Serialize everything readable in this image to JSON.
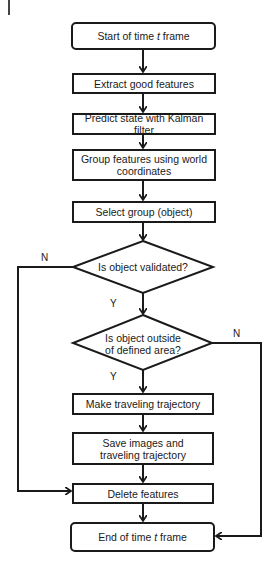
{
  "diagram": {
    "type": "flowchart",
    "nodes": {
      "start": {
        "label_pre": "Start of time ",
        "label_var": "t",
        "label_post": " frame",
        "shape": "rounded"
      },
      "extract": {
        "label": "Extract good features",
        "shape": "rect"
      },
      "predict": {
        "label": "Predict state with Kalman filter",
        "shape": "rect"
      },
      "group": {
        "label": "Group features using world coordinates",
        "shape": "rect"
      },
      "select": {
        "label": "Select group (object)",
        "shape": "rect"
      },
      "validated": {
        "label": "Is object validated?",
        "shape": "diamond"
      },
      "outside": {
        "line1": "Is object outside",
        "line2": "of defined area?",
        "shape": "diamond"
      },
      "make": {
        "label": "Make traveling trajectory",
        "shape": "rect"
      },
      "save": {
        "label": "Save images and traveling trajectory",
        "shape": "rect"
      },
      "delete": {
        "label": "Delete features",
        "shape": "rect"
      },
      "end": {
        "label_pre": "End of time ",
        "label_var": "t",
        "label_post": " frame",
        "shape": "rounded"
      }
    },
    "edge_labels": {
      "validated_no": "N",
      "validated_yes": "Y",
      "outside_no": "N",
      "outside_yes": "Y"
    },
    "edges": [
      [
        "start",
        "extract"
      ],
      [
        "extract",
        "predict"
      ],
      [
        "predict",
        "group"
      ],
      [
        "group",
        "select"
      ],
      [
        "select",
        "validated"
      ],
      [
        "validated",
        "outside",
        "Y"
      ],
      [
        "validated",
        "delete",
        "N"
      ],
      [
        "outside",
        "make",
        "Y"
      ],
      [
        "outside",
        "end",
        "N"
      ],
      [
        "make",
        "save"
      ],
      [
        "save",
        "delete"
      ],
      [
        "delete",
        "end"
      ]
    ]
  }
}
